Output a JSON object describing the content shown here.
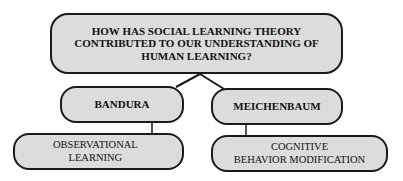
{
  "diagram": {
    "root": {
      "label": "HOW HAS SOCIAL LEARNING THEORY\nCONTRIBUTED TO OUR UNDERSTANDING OF\nHUMAN LEARNING?"
    },
    "branches": [
      {
        "label": "BANDURA",
        "child": {
          "label": "OBSERVATIONAL\nLEARNING"
        }
      },
      {
        "label": "MEICHENBAUM",
        "child": {
          "label": "COGNITIVE\nBEHAVIOR MODIFICATION"
        }
      }
    ],
    "colors": {
      "node_fill": "#dcdcdc",
      "node_border": "#1a1a1a",
      "text": "#111111",
      "background": "#ffffff"
    }
  }
}
